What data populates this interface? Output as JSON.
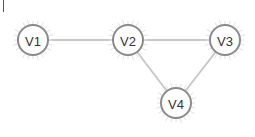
{
  "graph": {
    "type": "undirected",
    "nodes": [
      {
        "id": "V1",
        "label": "V1"
      },
      {
        "id": "V2",
        "label": "V2"
      },
      {
        "id": "V3",
        "label": "V3"
      },
      {
        "id": "V4",
        "label": "V4"
      }
    ],
    "edges": [
      {
        "from": "V1",
        "to": "V2"
      },
      {
        "from": "V2",
        "to": "V3"
      },
      {
        "from": "V2",
        "to": "V4"
      },
      {
        "from": "V3",
        "to": "V4"
      }
    ],
    "colors": {
      "edge": "#c9c9c9",
      "node_stroke": "#8a8a8a",
      "node_fill": "#ffffff",
      "label": "#333333"
    }
  }
}
